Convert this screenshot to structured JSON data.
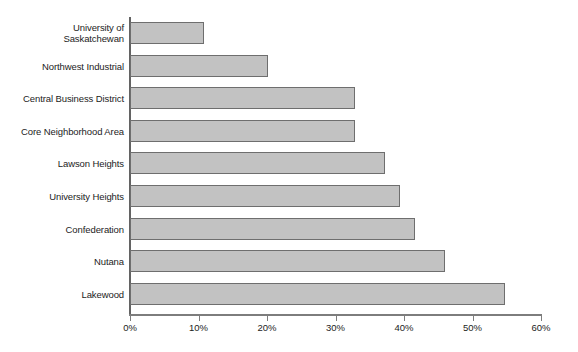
{
  "chart_data": {
    "type": "bar",
    "orientation": "horizontal",
    "title": "",
    "subtitle": "",
    "xlabel": "",
    "ylabel": "",
    "xlim": [
      0,
      60
    ],
    "x_tick_labels": [
      "0%",
      "10%",
      "20%",
      "30%",
      "40%",
      "50%",
      "60%"
    ],
    "x_ticks": [
      0,
      10,
      20,
      30,
      40,
      50,
      60
    ],
    "grid": false,
    "legend": false,
    "legend_position": "none",
    "units": "percent",
    "categories": [
      "University of Saskatchewan",
      "Northwest Industrial",
      "Central Business District",
      "Core Neighborhood Area",
      "Lawson Heights",
      "University Heights",
      "Confederation",
      "Nutana",
      "Lakewood"
    ],
    "values": [
      10.8,
      20.1,
      32.8,
      32.8,
      37.2,
      39.4,
      41.6,
      46.0,
      54.7
    ],
    "bars": [
      {
        "label_line1": "University of",
        "label_line2": "Saskatchewan",
        "value": 10.8
      },
      {
        "label_line1": "Northwest Industrial",
        "label_line2": "",
        "value": 20.1
      },
      {
        "label_line1": "Central Business District",
        "label_line2": "",
        "value": 32.8
      },
      {
        "label_line1": "Core Neighborhood Area",
        "label_line2": "",
        "value": 32.8
      },
      {
        "label_line1": "Lawson Heights",
        "label_line2": "",
        "value": 37.2
      },
      {
        "label_line1": "University Heights",
        "label_line2": "",
        "value": 39.4
      },
      {
        "label_line1": "Confederation",
        "label_line2": "",
        "value": 41.6
      },
      {
        "label_line1": "Nutana",
        "label_line2": "",
        "value": 46.0
      },
      {
        "label_line1": "Lakewood",
        "label_line2": "",
        "value": 54.7
      }
    ],
    "colors": {
      "bar_fill": "#c2c2c2",
      "bar_border": "#6e6e6e",
      "axis": "#7d7d7d",
      "text": "#1c1c1c",
      "background": "#ffffff"
    }
  }
}
